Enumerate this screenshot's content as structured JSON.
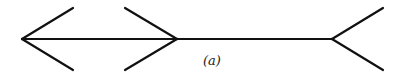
{
  "figure": {
    "label": "(a)",
    "stroke_color": "#111111",
    "background": "#ffffff"
  },
  "elements": [
    {
      "name": "left-arrowhead",
      "type": "arrowhead",
      "direction": "left"
    },
    {
      "name": "middle-arrowhead",
      "type": "arrowhead",
      "direction": "right"
    },
    {
      "name": "right-fins",
      "type": "fins",
      "direction": "outward"
    },
    {
      "name": "shaft",
      "type": "line"
    }
  ]
}
